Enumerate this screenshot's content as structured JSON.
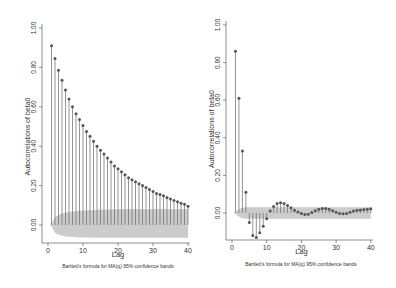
{
  "chart_data": [
    {
      "type": "bar",
      "subtype": "correlogram",
      "title": "",
      "xlabel": "Lag",
      "ylabel": "Autocorrelations of beta0",
      "caption": "Bartlett's formula for MA(q) 95% confidence bands",
      "xlim": [
        0,
        40
      ],
      "ylim": [
        -0.1,
        1.0
      ],
      "xticks": [
        "0",
        "10",
        "20",
        "30",
        "40"
      ],
      "yticks": [
        "0.00",
        "0.20",
        "0.40",
        "0.60",
        "0.80",
        "1.00"
      ],
      "grid": false,
      "legend": null,
      "x": [
        1,
        2,
        3,
        4,
        5,
        6,
        7,
        8,
        9,
        10,
        11,
        12,
        13,
        14,
        15,
        16,
        17,
        18,
        19,
        20,
        21,
        22,
        23,
        24,
        25,
        26,
        27,
        28,
        29,
        30,
        31,
        32,
        33,
        34,
        35,
        36,
        37,
        38,
        39,
        40
      ],
      "values": [
        0.91,
        0.845,
        0.785,
        0.735,
        0.685,
        0.64,
        0.6,
        0.565,
        0.535,
        0.505,
        0.475,
        0.45,
        0.425,
        0.4,
        0.38,
        0.36,
        0.34,
        0.32,
        0.3,
        0.285,
        0.27,
        0.255,
        0.24,
        0.23,
        0.22,
        0.21,
        0.2,
        0.19,
        0.18,
        0.17,
        0.16,
        0.155,
        0.148,
        0.14,
        0.132,
        0.125,
        0.118,
        0.11,
        0.105,
        0.095
      ],
      "confidence_band": {
        "upper": [
          0.005,
          0.04,
          0.05,
          0.058,
          0.062,
          0.066,
          0.068,
          0.07,
          0.072,
          0.073,
          0.074,
          0.075,
          0.076,
          0.077,
          0.078,
          0.078,
          0.079,
          0.079,
          0.08,
          0.08,
          0.08,
          0.08,
          0.08,
          0.08,
          0.08,
          0.08,
          0.08,
          0.08,
          0.08,
          0.08,
          0.08,
          0.08,
          0.08,
          0.08,
          0.08,
          0.08,
          0.08,
          0.08,
          0.08,
          0.08
        ],
        "lower": [
          -0.005,
          -0.04,
          -0.05,
          -0.055,
          -0.058,
          -0.06,
          -0.061,
          -0.062,
          -0.063,
          -0.063,
          -0.064,
          -0.064,
          -0.065,
          -0.065,
          -0.065,
          -0.065,
          -0.065,
          -0.065,
          -0.065,
          -0.065,
          -0.065,
          -0.065,
          -0.065,
          -0.065,
          -0.065,
          -0.065,
          -0.065,
          -0.065,
          -0.065,
          -0.065,
          -0.065,
          -0.065,
          -0.065,
          -0.065,
          -0.065,
          -0.065,
          -0.065,
          -0.065,
          -0.065,
          -0.065
        ]
      },
      "colors": {
        "marker": "#555555",
        "stem": "#666666",
        "band": "#cccccc",
        "axis": "#444444"
      }
    },
    {
      "type": "bar",
      "subtype": "correlogram",
      "title": "",
      "xlabel": "Lag",
      "ylabel": "Autocorrelations of beta0",
      "caption": "Bartlett's formula for MA(q) 95% confidence bands",
      "xlim": [
        0,
        40
      ],
      "ylim": [
        -0.15,
        1.0
      ],
      "xticks": [
        "0",
        "10",
        "20",
        "30",
        "40"
      ],
      "yticks": [
        "0.00",
        "0.20",
        "0.40",
        "0.60",
        "0.80",
        "1.00"
      ],
      "grid": false,
      "legend": null,
      "x": [
        1,
        2,
        3,
        4,
        5,
        6,
        7,
        8,
        9,
        10,
        11,
        12,
        13,
        14,
        15,
        16,
        17,
        18,
        19,
        20,
        21,
        22,
        23,
        24,
        25,
        26,
        27,
        28,
        29,
        30,
        31,
        32,
        33,
        34,
        35,
        36,
        37,
        38,
        39,
        40
      ],
      "values": [
        0.86,
        0.61,
        0.33,
        0.11,
        -0.05,
        -0.12,
        -0.13,
        -0.105,
        -0.07,
        -0.03,
        0.01,
        0.035,
        0.05,
        0.055,
        0.05,
        0.04,
        0.028,
        0.015,
        0.005,
        -0.003,
        -0.008,
        -0.006,
        0.002,
        0.012,
        0.02,
        0.024,
        0.024,
        0.02,
        0.012,
        0.004,
        -0.002,
        -0.004,
        -0.002,
        0.004,
        0.01,
        0.014,
        0.016,
        0.018,
        0.02,
        0.022
      ],
      "confidence_band": {
        "upper": [
          0.005,
          0.02,
          0.028,
          0.03,
          0.03,
          0.03,
          0.03,
          0.03,
          0.03,
          0.03,
          0.03,
          0.03,
          0.03,
          0.03,
          0.03,
          0.03,
          0.03,
          0.03,
          0.03,
          0.03,
          0.03,
          0.03,
          0.03,
          0.03,
          0.03,
          0.03,
          0.03,
          0.03,
          0.03,
          0.03,
          0.03,
          0.03,
          0.03,
          0.03,
          0.03,
          0.03,
          0.03,
          0.03,
          0.03,
          0.03
        ],
        "lower": [
          -0.005,
          -0.02,
          -0.028,
          -0.03,
          -0.03,
          -0.03,
          -0.03,
          -0.03,
          -0.03,
          -0.03,
          -0.03,
          -0.03,
          -0.03,
          -0.03,
          -0.03,
          -0.03,
          -0.03,
          -0.03,
          -0.03,
          -0.03,
          -0.03,
          -0.03,
          -0.03,
          -0.03,
          -0.03,
          -0.03,
          -0.03,
          -0.03,
          -0.03,
          -0.03,
          -0.03,
          -0.03,
          -0.03,
          -0.03,
          -0.03,
          -0.03,
          -0.03,
          -0.03,
          -0.03,
          -0.03
        ]
      },
      "colors": {
        "marker": "#555555",
        "stem": "#666666",
        "band": "#cccccc",
        "axis": "#444444"
      }
    }
  ],
  "layout": {
    "panels": [
      {
        "axis_x": 42,
        "x0": 48,
        "px_per_lag": 3.5,
        "y_zero": 225,
        "px_per_unit": 197,
        "axis_bottom": 243,
        "top": 28,
        "lag_label_y": 257,
        "caption_y": 268,
        "caption_x": 118,
        "ylabel_x": 30
      },
      {
        "axis_x": 226,
        "x0": 232,
        "px_per_lag": 3.47,
        "y_zero": 213,
        "px_per_unit": 188,
        "axis_bottom": 240,
        "top": 25,
        "lag_label_y": 254,
        "caption_x": 301,
        "caption_y": 266,
        "ylabel_x": 214
      }
    ]
  }
}
